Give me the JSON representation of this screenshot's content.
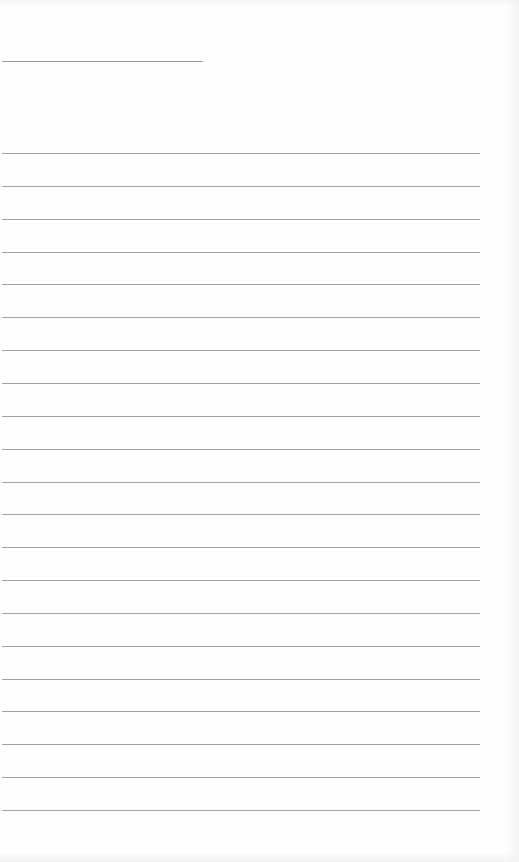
{
  "document": {
    "type": "lined-page",
    "header_line": {
      "x": 2,
      "y": 61,
      "width": 201
    },
    "rules": {
      "count": 21,
      "start_y": 153,
      "spacing": 32.85,
      "x": 2,
      "width": 478
    },
    "colors": {
      "paper": "#fefefe",
      "rule": "#a2a2a2",
      "header_line": "#9a9a9a"
    }
  }
}
